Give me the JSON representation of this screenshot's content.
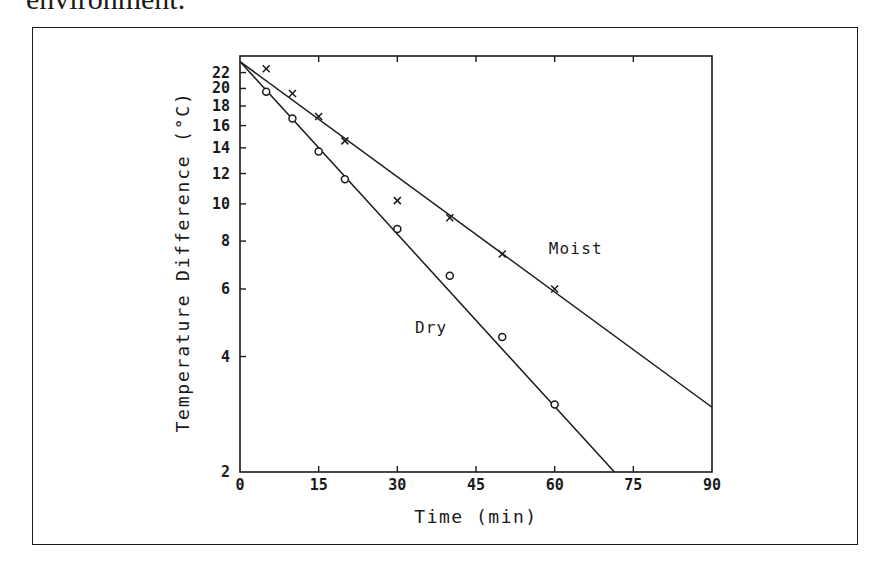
{
  "page": {
    "caption_fragment": "environment."
  },
  "chart_data": {
    "type": "scatter",
    "title": "",
    "xlabel": "Time (min)",
    "ylabel": "Temperature Difference (°C)",
    "xscale": "linear",
    "yscale": "log",
    "xlim": [
      0,
      90
    ],
    "ylim": [
      2,
      24.3
    ],
    "grid": false,
    "legend": "inline labels",
    "x_ticks": [
      0,
      15,
      30,
      45,
      60,
      75,
      90
    ],
    "x_tick_labels": [
      "0",
      "15",
      "30",
      "45",
      "60",
      "75",
      "90"
    ],
    "y_ticks": [
      2,
      4,
      6,
      8,
      10,
      12,
      14,
      16,
      18,
      20,
      22
    ],
    "y_tick_labels": [
      "2",
      "4",
      "6",
      "8",
      "10",
      "12",
      "14",
      "16",
      "18",
      "20",
      "22"
    ],
    "series": [
      {
        "name": "Moist",
        "marker": "x",
        "x": [
          5,
          10,
          15,
          20,
          30,
          40,
          50,
          60
        ],
        "y": [
          22.5,
          19.4,
          16.9,
          14.6,
          10.2,
          9.2,
          7.4,
          6.0
        ],
        "fit_line": {
          "x": [
            0,
            90
          ],
          "y": [
            23.5,
            2.95
          ]
        },
        "label_position": {
          "x": 60,
          "y": 7.4
        }
      },
      {
        "name": "Dry",
        "marker": "o",
        "x": [
          5,
          10,
          15,
          20,
          30,
          40,
          50,
          60
        ],
        "y": [
          19.6,
          16.7,
          13.7,
          11.6,
          8.6,
          6.5,
          4.5,
          3.0
        ],
        "fit_line": {
          "x": [
            0,
            71.4
          ],
          "y": [
            23.5,
            2.0
          ]
        },
        "label_position": {
          "x": 34.5,
          "y": 4.6
        }
      }
    ]
  }
}
